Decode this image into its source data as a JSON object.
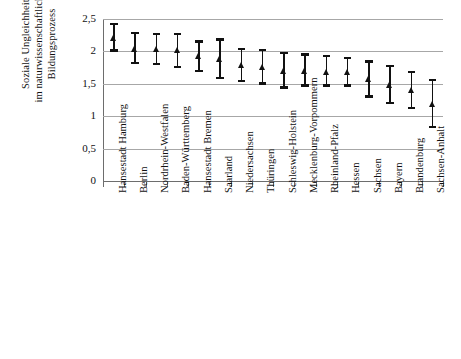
{
  "chart_data": {
    "type": "scatter",
    "title": "",
    "xlabel": "",
    "ylabel": "Soziale Ungleichheit\nim naturwissenschaftlichen\nBildungsprozess",
    "ylim": [
      0,
      2.5
    ],
    "ytick_labels": [
      "0",
      "0,5",
      "1",
      "1,5",
      "2",
      "2,5"
    ],
    "ytick_values": [
      0,
      0.5,
      1,
      1.5,
      2,
      2.5
    ],
    "grid": true,
    "legend": "none",
    "marker": "triangle",
    "errorbars": true,
    "categories": [
      "Hansestadt Hamburg",
      "Berlin",
      "Nordrhein-Westfalen",
      "Baden-Württemberg",
      "Hansestadt Bremen",
      "Saarland",
      "Niedersachsen",
      "Thüringen",
      "Schleswig-Holstein",
      "Mecklenburg-Vorpommern",
      "Rheinland-Pfalz",
      "Hessen",
      "Sachsen",
      "Bayern",
      "Brandenburg",
      "Sachsen-Anhalt"
    ],
    "values": [
      2.21,
      2.04,
      2.04,
      2.02,
      1.92,
      1.88,
      1.79,
      1.76,
      1.7,
      1.69,
      1.68,
      1.68,
      1.57,
      1.48,
      1.4,
      1.19
    ],
    "ci_low": [
      2.0,
      1.81,
      1.79,
      1.75,
      1.68,
      1.58,
      1.53,
      1.49,
      1.43,
      1.46,
      1.46,
      1.46,
      1.29,
      1.19,
      1.11,
      0.82
    ],
    "ci_high": [
      2.44,
      2.3,
      2.29,
      2.29,
      2.17,
      2.2,
      2.06,
      2.04,
      1.99,
      1.97,
      1.94,
      1.91,
      1.86,
      1.79,
      1.7,
      1.57
    ]
  }
}
